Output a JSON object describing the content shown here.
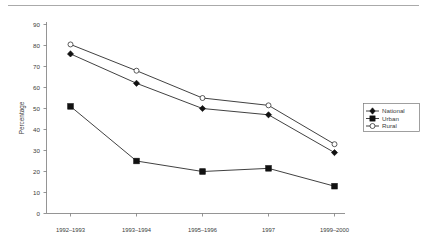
{
  "chart_data": {
    "type": "line",
    "title": "",
    "xlabel": "",
    "ylabel": "Percentage",
    "ylim": [
      0,
      90
    ],
    "ytick_step": 10,
    "grid": false,
    "legend_position": "right",
    "categories": [
      "1992–1993",
      "1993–1994",
      "1995–1996",
      "1997",
      "1999–2000"
    ],
    "yticks": [
      "0",
      "10",
      "20",
      "30",
      "40",
      "50",
      "60",
      "70",
      "80",
      "90"
    ],
    "series": [
      {
        "name": "National",
        "marker": "filled-diamond",
        "values": [
          76,
          62,
          50,
          47,
          29
        ]
      },
      {
        "name": "Urban",
        "marker": "filled-square",
        "values": [
          51,
          25,
          20,
          21.5,
          13
        ]
      },
      {
        "name": "Rural",
        "marker": "open-circle",
        "values": [
          80.5,
          68,
          55,
          51.5,
          33
        ]
      }
    ]
  },
  "axes": {
    "y_title": "Percentage"
  },
  "legend": {
    "entries": [
      {
        "label": "National"
      },
      {
        "label": "Urban"
      },
      {
        "label": "Rural"
      }
    ]
  }
}
